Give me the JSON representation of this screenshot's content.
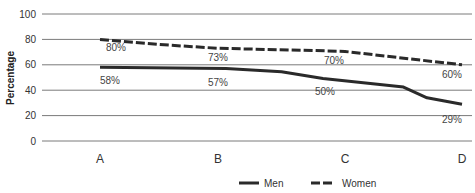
{
  "chart_data": {
    "type": "line",
    "title": "",
    "xlabel": "",
    "ylabel": "Percentage",
    "ylim": [
      0,
      100
    ],
    "yticks": [
      0,
      20,
      40,
      60,
      80,
      100
    ],
    "grid": true,
    "legend_position": "bottom",
    "categories": [
      "A",
      "B",
      "C",
      "D"
    ],
    "series": [
      {
        "name": "Men",
        "style": "solid",
        "color": "#2a2a2a",
        "values": [
          58,
          57,
          50,
          29
        ],
        "labels": [
          "58%",
          "57%",
          "50%",
          "29%"
        ]
      },
      {
        "name": "Women",
        "style": "dashed",
        "color": "#2a2a2a",
        "values": [
          80,
          73,
          70,
          60
        ],
        "labels": [
          "80%",
          "73%",
          "70%",
          "60%"
        ]
      }
    ]
  },
  "legend": {
    "men_label": "Men",
    "women_label": "Women"
  },
  "axis": {
    "ylabel": "Percentage"
  }
}
